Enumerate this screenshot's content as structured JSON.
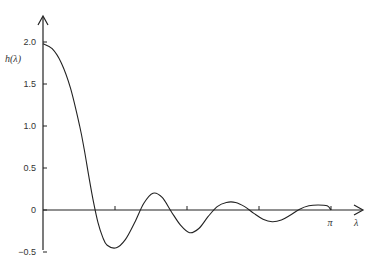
{
  "chart_data": {
    "type": "line",
    "title": "",
    "xlabel": "λ",
    "ylabel": "h(λ)",
    "xlim": [
      0,
      3.14159
    ],
    "ylim": [
      -0.5,
      2.0
    ],
    "grid": false,
    "legend": null,
    "y_ticks": [
      {
        "value": 2.0,
        "label": "2.0"
      },
      {
        "value": 1.5,
        "label": "1.5"
      },
      {
        "value": 1.0,
        "label": "1.0"
      },
      {
        "value": 0.5,
        "label": "0.5"
      },
      {
        "value": 0,
        "label": "0"
      },
      {
        "value": -0.5,
        "label": "−0.5"
      }
    ],
    "x_ticks": [
      {
        "value": 0.7854,
        "label": ""
      },
      {
        "value": 1.5708,
        "label": ""
      },
      {
        "value": 2.3562,
        "label": ""
      },
      {
        "value": 3.14159,
        "label": "π"
      }
    ],
    "series": [
      {
        "name": "h(λ)",
        "x": [
          0,
          0.1,
          0.2,
          0.3,
          0.4,
          0.45,
          0.5,
          0.55,
          0.6,
          0.65,
          0.7,
          0.8,
          0.9,
          1.0,
          1.1,
          1.2,
          1.3,
          1.4,
          1.5,
          1.6,
          1.7,
          1.8,
          1.9,
          2.0,
          2.1,
          2.2,
          2.3,
          2.4,
          2.5,
          2.6,
          2.7,
          2.8,
          2.9,
          3.0,
          3.1,
          3.14159
        ],
        "y": [
          1.98,
          1.92,
          1.75,
          1.45,
          1.0,
          0.72,
          0.4,
          0.1,
          -0.15,
          -0.32,
          -0.42,
          -0.45,
          -0.35,
          -0.15,
          0.08,
          0.2,
          0.15,
          -0.02,
          -0.18,
          -0.27,
          -0.22,
          -0.08,
          0.04,
          0.09,
          0.09,
          0.04,
          -0.04,
          -0.11,
          -0.14,
          -0.12,
          -0.06,
          0.01,
          0.05,
          0.06,
          0.05,
          0.0
        ]
      }
    ],
    "axis_labels": {
      "x": "λ",
      "x_end": "π",
      "y": "h(λ)"
    }
  }
}
